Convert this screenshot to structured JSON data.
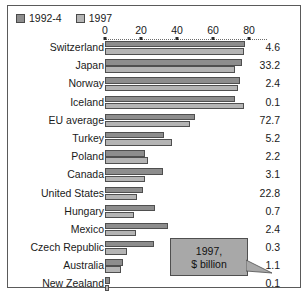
{
  "chart_data": {
    "type": "bar",
    "orientation": "horizontal",
    "title": "",
    "subtitle": "",
    "xlabel": "",
    "ylabel": "",
    "xlim": [
      0,
      88
    ],
    "grid": false,
    "axis": {
      "tick_labels": [
        "0",
        "20",
        "40",
        "60",
        "80"
      ],
      "tick_values": [
        0,
        20,
        40,
        60,
        80
      ],
      "position": "top",
      "style": "dotted"
    },
    "legend": {
      "position": "top-left",
      "entries": [
        {
          "label": "1992-4",
          "color": "#8d8d8d"
        },
        {
          "label": "1997",
          "color": "#b4b4b4"
        }
      ]
    },
    "categories": [
      "Switzerland",
      "Japan",
      "Norway",
      "Iceland",
      "EU average",
      "Turkey",
      "Poland",
      "Canada",
      "United States",
      "Hungary",
      "Mexico",
      "Czech Republic",
      "Australia",
      "New Zealand"
    ],
    "series": [
      {
        "name": "1992-4",
        "color": "#8d8d8d",
        "values": [
          78,
          76,
          75,
          72,
          50,
          33,
          22,
          32,
          21,
          28,
          35,
          27,
          10,
          3
        ]
      },
      {
        "name": "1997",
        "color": "#b4b4b4",
        "values": [
          77,
          72,
          74,
          77,
          47,
          37,
          24,
          22,
          18,
          16,
          17,
          12,
          9,
          2
        ]
      }
    ],
    "data_labels": {
      "header": "1997, $ billion",
      "values": [
        "4.6",
        "33.2",
        "2.4",
        "0.1",
        "72.7",
        "5.2",
        "2.2",
        "3.1",
        "22.8",
        "0.7",
        "2.4",
        "0.3",
        "1.1",
        "0.1"
      ]
    },
    "annotations": [
      {
        "name": "value-column-callout",
        "lines": [
          "1997,",
          "$ billion"
        ],
        "points_to": "New Zealand"
      }
    ]
  },
  "callout": {
    "line1": "1997,",
    "line2": "$ billion"
  },
  "colors": {
    "series_1992_4": "#8d8d8d",
    "series_1997": "#b4b4b4",
    "border": "#4f4f4f",
    "frame": "#5a5a5a",
    "text": "#1a1a1a",
    "callout_bg": "#a8a8a8"
  }
}
